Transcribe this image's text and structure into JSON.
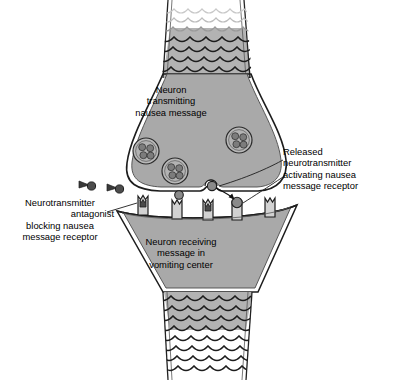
{
  "figure": {
    "background_color": "#ffffff",
    "line_color": "#1a1a1a",
    "cytoplasm_fill": "#a8a8a8",
    "axon_fill": "#b5b5b5",
    "receptor_fill": "#d4d4d4",
    "molecule_fill": "#7a7a7a",
    "antagonist_fill": "#4a4a4a"
  },
  "labels": {
    "presynaptic": {
      "name": "presynaptic-neuron-label",
      "lines": [
        "Neuron",
        "transmitting",
        "nausea message"
      ]
    },
    "postsynaptic": {
      "name": "postsynaptic-neuron-label",
      "lines": [
        "Neuron receiving",
        "message in",
        "vomiting center"
      ]
    },
    "released": {
      "name": "released-neurotransmitter-label",
      "lines": [
        "Released",
        "neurotransmitter",
        "activating nausea",
        "message receptor"
      ]
    },
    "antagonist": {
      "name": "antagonist-label",
      "lines": [
        "Neurotransmitter",
        "antagonist",
        "blocking nausea",
        "message receptor"
      ]
    }
  },
  "structures": {
    "presynaptic_axon": {
      "label": "presynaptic axon with myelin scallops",
      "scallop_rows": 8,
      "fading_rows": 3
    },
    "presynaptic_terminal": {
      "label": "presynaptic terminal bouton",
      "vesicle_count": 3,
      "vesicles": [
        {
          "name": "vesicle-left",
          "cx": 146,
          "cy": 151,
          "r": 13,
          "granules": 4
        },
        {
          "name": "vesicle-right",
          "cx": 239,
          "cy": 140,
          "r": 13,
          "granules": 4
        },
        {
          "name": "vesicle-center",
          "cx": 175,
          "cy": 171,
          "r": 13,
          "granules": 4
        }
      ],
      "release_site": {
        "name": "vesicle-fusion-pore",
        "cx": 211,
        "cy": 181
      }
    },
    "synaptic_cleft": {
      "label": "synaptic cleft",
      "free_neurotransmitter": [
        {
          "name": "free-neurotransmitter-1",
          "cx": 212,
          "cy": 184,
          "r": 4.4
        },
        {
          "name": "free-neurotransmitter-2",
          "cx": 179,
          "cy": 194,
          "r": 4.2
        }
      ],
      "antagonist_molecules": [
        {
          "name": "antagonist-molecule-1",
          "cx": 88,
          "cy": 184
        },
        {
          "name": "antagonist-molecule-2",
          "cx": 116,
          "cy": 188
        }
      ]
    },
    "postsynaptic_membrane": {
      "label": "postsynaptic membrane with receptors",
      "receptor_count": 5,
      "receptors": [
        {
          "name": "receptor-1-blocked",
          "x": 144,
          "occupant": "antagonist"
        },
        {
          "name": "receptor-2-empty",
          "x": 178,
          "occupant": "none"
        },
        {
          "name": "receptor-3-blocked",
          "x": 209,
          "occupant": "antagonist"
        },
        {
          "name": "receptor-4-activated",
          "x": 238,
          "occupant": "neurotransmitter"
        },
        {
          "name": "receptor-5-empty",
          "x": 270,
          "occupant": "none"
        }
      ]
    },
    "postsynaptic_axon": {
      "label": "postsynaptic axon with myelin scallops",
      "scallop_rows": 8,
      "fading_rows": 4
    },
    "arrow": {
      "name": "release-arrow",
      "label": "arrow from release site to activated receptor"
    },
    "leader_lines": [
      {
        "name": "leader-released-to-release-site"
      },
      {
        "name": "leader-released-to-receptor"
      },
      {
        "name": "leader-antagonist-to-receptor"
      }
    ]
  }
}
